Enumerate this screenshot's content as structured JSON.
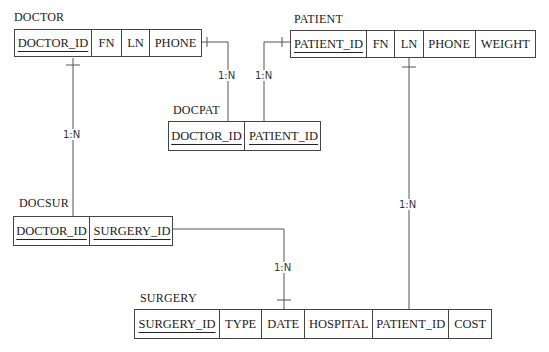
{
  "entities": {
    "doctor": {
      "name": "DOCTOR",
      "fields": [
        "DOCTOR_ID",
        "FN",
        "LN",
        "PHONE"
      ],
      "primary_key": "DOCTOR_ID"
    },
    "patient": {
      "name": "PATIENT",
      "fields": [
        "PATIENT_ID",
        "FN",
        "LN",
        "PHONE",
        "WEIGHT"
      ],
      "primary_key": "PATIENT_ID"
    },
    "docpat": {
      "name": "DOCPAT",
      "fields": [
        "DOCTOR_ID",
        "PATIENT_ID"
      ],
      "primary_key": [
        "DOCTOR_ID",
        "PATIENT_ID"
      ]
    },
    "docsur": {
      "name": "DOCSUR",
      "fields": [
        "DOCTOR_ID",
        "SURGERY_ID"
      ],
      "primary_key": [
        "DOCTOR_ID",
        "SURGERY_ID"
      ]
    },
    "surgery": {
      "name": "SURGERY",
      "fields": [
        "SURGERY_ID",
        "TYPE",
        "DATE",
        "HOSPITAL",
        "PATIENT_ID",
        "COST"
      ],
      "primary_key": "SURGERY_ID"
    }
  },
  "relationships": [
    {
      "from": "DOCTOR",
      "to": "DOCPAT",
      "cardinality": "1:N"
    },
    {
      "from": "PATIENT",
      "to": "DOCPAT",
      "cardinality": "1:N"
    },
    {
      "from": "DOCTOR",
      "to": "DOCSUR",
      "cardinality": "1:N"
    },
    {
      "from": "SURGERY",
      "to": "DOCSUR",
      "cardinality": "1:N"
    },
    {
      "from": "PATIENT",
      "to": "SURGERY",
      "cardinality": "1:N"
    }
  ]
}
